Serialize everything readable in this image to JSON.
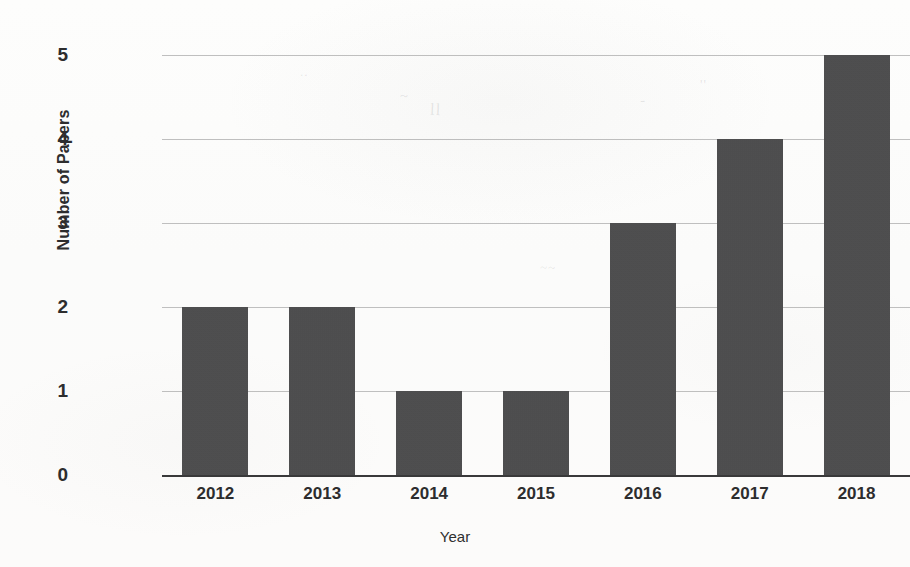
{
  "chart_data": {
    "type": "bar",
    "title": "",
    "xlabel": "Year",
    "ylabel": "Number of Papers",
    "categories": [
      "2012",
      "2013",
      "2014",
      "2015",
      "2016",
      "2017",
      "2018"
    ],
    "values": [
      2,
      2,
      1,
      1,
      3,
      4,
      5
    ],
    "series": [
      {
        "name": "Number of Papers",
        "values": [
          2,
          2,
          1,
          1,
          3,
          4,
          5
        ]
      }
    ],
    "ylim": [
      0,
      5
    ],
    "yticks": [
      "0",
      "1",
      "2",
      "3",
      "4",
      "5"
    ],
    "ytick_values": [
      0,
      1,
      2,
      3,
      4,
      5
    ],
    "grid": "horizontal",
    "legend": "none",
    "bar_color": "#4a4a4b",
    "gridline_color": "#b4b4b4",
    "axis_color": "#39393a",
    "background_color": "#fcfcfb",
    "text_color": "#2d2d2e"
  },
  "scan_artifacts": {
    "note": "faint bleed-through marks from reverse side of scanned page",
    "marks": [
      "~",
      "ll",
      "..",
      "-",
      "''",
      "~~"
    ]
  }
}
